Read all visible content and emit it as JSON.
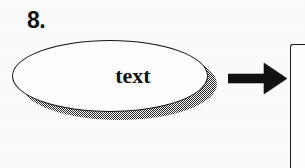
{
  "figure": {
    "type": "flowchart-fragment",
    "background_color": "#fbfbfb",
    "ink_color": "#121212",
    "item_number": "8.",
    "nodes": [
      {
        "id": "ellipse-node",
        "shape": "ellipse",
        "label": "text",
        "fill": "#fdfdfd",
        "stroke": "#161616",
        "shadow": "dithered-halftone",
        "shadow_color": "#2a2a2a"
      },
      {
        "id": "right-rect-node",
        "shape": "rectangle",
        "label": "",
        "fill": "#fdfdfd",
        "stroke": "#1b1b1b",
        "clipped": "true"
      }
    ],
    "connectors": [
      {
        "id": "arrow-connector",
        "kind": "block-arrow",
        "direction": "right",
        "color": "#121212",
        "from": "ellipse-node",
        "to": "right-rect-node"
      }
    ]
  }
}
